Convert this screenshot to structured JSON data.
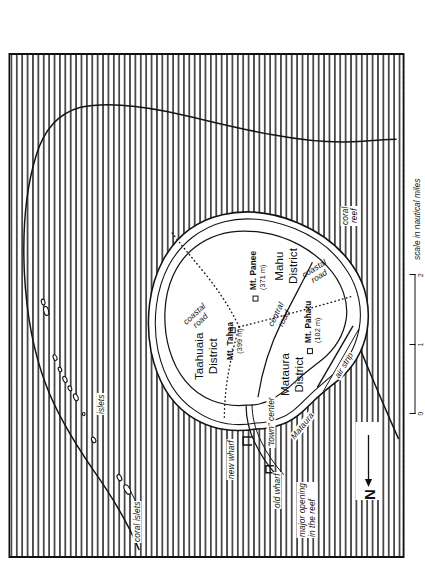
{
  "figure": {
    "caption": "Based on a map of Robert Aitken (1930:170); additions of V. Lockwood",
    "orientation_note": "rotated"
  },
  "scale_bar": {
    "caption": "scale in nautical miles",
    "ticks": [
      "0",
      "1",
      "2"
    ],
    "units": "nautical miles"
  },
  "compass": {
    "letter": "N"
  },
  "map": {
    "districts": [
      {
        "name": "Taahuaia District",
        "line1": "Taahuaia",
        "line2": "District"
      },
      {
        "name": "Mataura District",
        "line1": "Mataura",
        "line2": "District"
      },
      {
        "name": "Mahu District",
        "line1": "Mahu",
        "line2": "District"
      }
    ],
    "peaks": [
      {
        "name": "Mt. Tahaa",
        "elevation": "(399 m)"
      },
      {
        "name": "Mt. Panee",
        "elevation": "(371 m)"
      },
      {
        "name": "Mt. Pahatu",
        "elevation": "(102 m)"
      }
    ],
    "roads": [
      {
        "label_line1": "coastal",
        "label_line2": "road",
        "id": "coastal-road-north"
      },
      {
        "label_line1": "coastal",
        "label_line2": "road",
        "id": "coastal-road-south"
      },
      {
        "label_line1": "central",
        "label_line2": "road",
        "id": "central-road"
      }
    ],
    "features": [
      {
        "id": "coral-islets",
        "label": "coral islets"
      },
      {
        "id": "islets",
        "label": "islets"
      },
      {
        "id": "new-wharf",
        "label": "new wharf"
      },
      {
        "id": "old-wharf",
        "label": "old wharf"
      },
      {
        "id": "town-center",
        "label": "“town” center"
      },
      {
        "id": "mataura-village",
        "label": "Mataura"
      },
      {
        "id": "major-opening",
        "label_line1": "major opening",
        "label_line2": "in the reef"
      },
      {
        "id": "air-strip",
        "label": "air strip"
      },
      {
        "id": "coral-reef",
        "label_line1": "coral",
        "label_line2": "reef"
      }
    ]
  },
  "colors": {
    "ink": "#101010",
    "paper": "#ffffff",
    "ocean_stipple": "#3a3a3a"
  }
}
